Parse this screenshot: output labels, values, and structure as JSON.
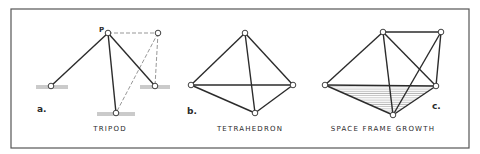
{
  "figure": {
    "frame": {
      "x": 11,
      "y": 9,
      "width": 458,
      "height": 139,
      "color": "#555555"
    },
    "colors": {
      "line": "#2b2b2b",
      "dashed": "#6a6a6a",
      "ground": "#8a8a8a",
      "node_fill": "#ffffff",
      "hatch": "#9a9a9a"
    },
    "panels": [
      {
        "id": "a",
        "letter": "a.",
        "caption": "TRIPOD",
        "point_label": "P",
        "letter_pos": [
          37,
          112
        ],
        "caption_pos": [
          110,
          131
        ],
        "point_label_pos": [
          99,
          32
        ],
        "nodes": {
          "P": [
            108,
            33
          ],
          "L": [
            51,
            86
          ],
          "R": [
            155,
            86
          ],
          "B": [
            116,
            113
          ],
          "T": [
            158,
            33
          ]
        },
        "solid_edges": [
          [
            "P",
            "L"
          ],
          [
            "P",
            "R"
          ],
          [
            "P",
            "B"
          ]
        ],
        "dashed_edges": [
          [
            "P",
            "T"
          ],
          [
            "T",
            "R"
          ],
          [
            "T",
            "B"
          ]
        ],
        "grounds": [
          {
            "x1": 36,
            "x2": 68,
            "y": 86
          },
          {
            "x1": 140,
            "x2": 170,
            "y": 86
          },
          {
            "x1": 97,
            "x2": 135,
            "y": 113
          }
        ]
      },
      {
        "id": "b",
        "letter": "b.",
        "caption": "TETRAHEDRON",
        "letter_pos": [
          187,
          114
        ],
        "caption_pos": [
          250,
          131
        ],
        "nodes": {
          "T": [
            245,
            33
          ],
          "L": [
            191,
            85
          ],
          "R": [
            293,
            85
          ],
          "B": [
            255,
            113
          ]
        },
        "solid_edges": [
          [
            "T",
            "L"
          ],
          [
            "T",
            "R"
          ],
          [
            "T",
            "B"
          ],
          [
            "L",
            "R"
          ],
          [
            "L",
            "B"
          ],
          [
            "R",
            "B"
          ]
        ]
      },
      {
        "id": "c",
        "letter": "c.",
        "caption": "SPACE FRAME GROWTH",
        "letter_pos": [
          432,
          109
        ],
        "caption_pos": [
          383,
          131
        ],
        "nodes": {
          "T": [
            383,
            32
          ],
          "TR": [
            441,
            32
          ],
          "L": [
            325,
            85
          ],
          "R": [
            436,
            86
          ],
          "B": [
            393,
            115
          ]
        },
        "solid_edges": [
          [
            "T",
            "L"
          ],
          [
            "T",
            "R"
          ],
          [
            "T",
            "B"
          ],
          [
            "T",
            "TR"
          ],
          [
            "TR",
            "R"
          ],
          [
            "TR",
            "B"
          ],
          [
            "L",
            "R"
          ],
          [
            "L",
            "B"
          ],
          [
            "R",
            "B"
          ]
        ],
        "hatched_face": [
          "L",
          "R",
          "B"
        ]
      }
    ]
  }
}
